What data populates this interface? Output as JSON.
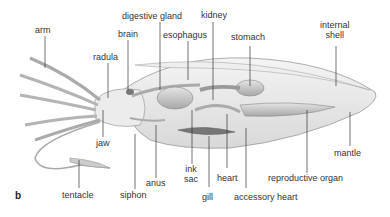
{
  "figure": {
    "panel_letter": "b",
    "labels": {
      "arm": "arm",
      "brain": "brain",
      "radula": "radula",
      "digestive_gland": "digestive gland",
      "esophagus": "esophagus",
      "kidney": "kidney",
      "stomach": "stomach",
      "internal_shell_1": "internal",
      "internal_shell_2": "shell",
      "jaw": "jaw",
      "anus": "anus",
      "ink_sac_1": "ink",
      "ink_sac_2": "sac",
      "heart": "heart",
      "gill": "gill",
      "accessory_heart": "accessory heart",
      "reproductive_organ": "reproductive organ",
      "mantle": "mantle",
      "tentacle": "tentacle",
      "siphon": "siphon"
    }
  }
}
